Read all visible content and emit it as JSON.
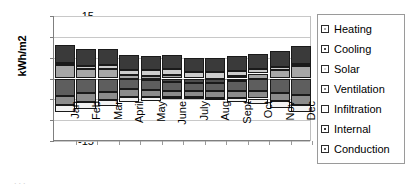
{
  "axis": {
    "ylabel": "kWh/m2",
    "yticks": [
      "15",
      "10",
      "5",
      "0",
      "-5",
      "-10",
      "-15"
    ]
  },
  "legend": {
    "items": [
      {
        "label": "Heating",
        "color": "#a6a6a6"
      },
      {
        "label": "Cooling",
        "color": "#4d4d4d"
      },
      {
        "label": "Solar",
        "color": "#cccccc"
      },
      {
        "label": "Ventilation",
        "color": "#8c8c8c"
      },
      {
        "label": "Infiltration",
        "color": "#f2f2f2"
      },
      {
        "label": "Internal",
        "color": "#3a3a3a"
      },
      {
        "label": "Conduction",
        "color": "#5e5e5e"
      }
    ]
  },
  "footer": {
    "artifact": "..."
  },
  "chart_data": {
    "type": "bar",
    "stacked": true,
    "title": "",
    "xlabel": "",
    "ylabel": "kWh/m2",
    "ylim": [
      -15,
      15
    ],
    "yticks": [
      15,
      10,
      5,
      0,
      -5,
      -10,
      -15
    ],
    "grid": true,
    "legend_position": "right",
    "categories": [
      "Jan",
      "Feb",
      "Mar",
      "April",
      "May",
      "June",
      "July",
      "Aug",
      "Sept",
      "Oct",
      "Nov",
      "Dec"
    ],
    "series": [
      {
        "name": "Heating",
        "color": "#a6a6a6",
        "values": [
          3.2,
          2.3,
          2.2,
          0.9,
          0.6,
          0.8,
          0.0,
          0.0,
          0.5,
          1.2,
          2.0,
          3.1
        ]
      },
      {
        "name": "Cooling",
        "color": "#4d4d4d",
        "values": [
          0.0,
          0.0,
          0.0,
          0.0,
          -0.4,
          -0.8,
          -1.1,
          -1.0,
          -0.6,
          0.0,
          0.0,
          0.0
        ]
      },
      {
        "name": "Solar",
        "color": "#cccccc",
        "values": [
          0.6,
          0.7,
          1.0,
          1.2,
          1.4,
          1.5,
          1.6,
          1.5,
          1.3,
          1.0,
          0.7,
          0.5
        ]
      },
      {
        "name": "Ventilation",
        "color": "#8c8c8c",
        "values": [
          -2.2,
          -2.2,
          -2.0,
          -1.9,
          -1.7,
          -1.5,
          -1.4,
          -1.5,
          -1.7,
          -1.9,
          -2.1,
          -2.3
        ]
      },
      {
        "name": "Infiltration",
        "color": "#f2f2f2",
        "values": [
          -1.7,
          -1.6,
          -1.5,
          -1.2,
          -0.9,
          -0.6,
          -0.5,
          -0.6,
          -0.9,
          -1.2,
          -1.5,
          -1.8
        ]
      },
      {
        "name": "Internal",
        "color": "#3a3a3a",
        "values": [
          4.3,
          4.0,
          3.8,
          3.6,
          3.5,
          3.4,
          3.4,
          3.5,
          3.6,
          3.8,
          4.0,
          4.2
        ]
      },
      {
        "name": "Conduction",
        "color": "#5e5e5e",
        "values": [
          -4.2,
          -3.5,
          -3.2,
          -2.6,
          -2.3,
          -2.1,
          -2.0,
          -2.1,
          -2.4,
          -2.9,
          -3.4,
          -4.0
        ]
      }
    ],
    "positive_totals": [
      8.1,
      7.0,
      7.0,
      5.7,
      5.5,
      5.7,
      5.0,
      5.0,
      5.4,
      6.0,
      6.7,
      7.8
    ],
    "negative_totals": [
      -8.1,
      -7.3,
      -6.7,
      -5.7,
      -5.3,
      -5.0,
      -5.0,
      -5.2,
      -5.6,
      -6.0,
      -7.0,
      -8.1
    ]
  }
}
